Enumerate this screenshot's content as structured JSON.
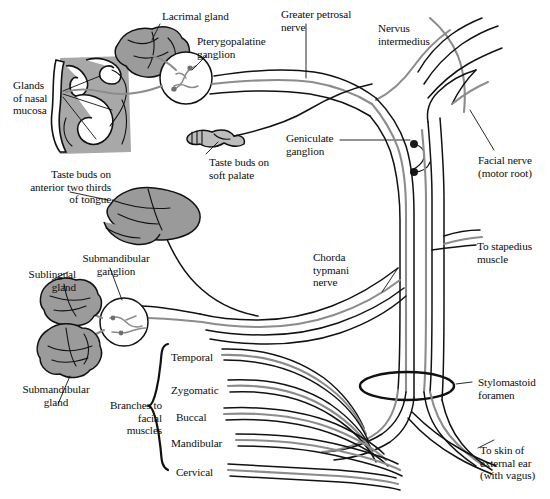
{
  "figure": {
    "width": 550,
    "height": 499,
    "background": "#ffffff"
  },
  "colors": {
    "ink": "#0d0d0d",
    "parasympathetic_gray": "#8c8c8c",
    "motor_dark": "#3a3a3a",
    "gland_fill": "#9b9b9b",
    "gland_fill_light": "#b4b4b4",
    "nasal_fill": "#a8a8a8",
    "tongue_fill": "#9a9a9a",
    "palate_fill": "#bdbdbd",
    "white": "#ffffff"
  },
  "labels": [
    {
      "id": "lacrimal-gland",
      "text": "Lacrimal gland",
      "x": 162,
      "y": 10,
      "align": "left"
    },
    {
      "id": "pterygopalatine",
      "text": "Pterygopalatine\nganglion",
      "x": 197,
      "y": 35,
      "align": "left"
    },
    {
      "id": "greater-petrosal",
      "text": "Greater petrosal\nnerve",
      "x": 281,
      "y": 8,
      "align": "left"
    },
    {
      "id": "nervus-intermedius",
      "text": "Nervus\nintermedius",
      "x": 378,
      "y": 22,
      "align": "left"
    },
    {
      "id": "glands-nasal-mucosa",
      "text": "Glands\nof nasal\nmucosa",
      "x": 13,
      "y": 79,
      "align": "left"
    },
    {
      "id": "geniculate-ganglion",
      "text": "Geniculate\nganglion",
      "x": 286,
      "y": 132,
      "align": "left"
    },
    {
      "id": "facial-nerve-motor",
      "text": "Facial nerve\n(motor root)",
      "x": 478,
      "y": 154,
      "align": "left"
    },
    {
      "id": "taste-soft-palate",
      "text": "Taste buds on\nsoft palate",
      "x": 209,
      "y": 156,
      "align": "left"
    },
    {
      "id": "taste-tongue",
      "text": "Taste buds on\nanterior two thirds\nof tongue",
      "x": 6,
      "y": 168,
      "align": "right",
      "w": 105
    },
    {
      "id": "chorda-tympani",
      "text": "Chorda\ntypmani\nnerve",
      "x": 313,
      "y": 251,
      "align": "left"
    },
    {
      "id": "to-stapedius",
      "text": "To stapedius\nmuscle",
      "x": 477,
      "y": 240,
      "align": "left"
    },
    {
      "id": "submandibular-ganglion",
      "text": "Submandibular\nganglion",
      "x": 66,
      "y": 252,
      "align": "center",
      "w": 100
    },
    {
      "id": "sublingual-gland",
      "text": "Sublingual\ngland",
      "x": 10,
      "y": 268,
      "align": "right",
      "w": 66
    },
    {
      "id": "submandibular-gland",
      "text": "Submandibular\ngland",
      "x": 12,
      "y": 383,
      "align": "center",
      "w": 88
    },
    {
      "id": "branches-facial",
      "text": "Branches to\nfacial\nmuscles",
      "x": 100,
      "y": 399,
      "align": "right",
      "w": 62
    },
    {
      "id": "temporal",
      "text": "Temporal",
      "x": 171,
      "y": 351,
      "align": "left"
    },
    {
      "id": "zygomatic",
      "text": "Zygomatic",
      "x": 171,
      "y": 384,
      "align": "left"
    },
    {
      "id": "buccal",
      "text": "Buccal",
      "x": 176,
      "y": 411,
      "align": "left"
    },
    {
      "id": "mandibular",
      "text": "Mandibular",
      "x": 171,
      "y": 437,
      "align": "left"
    },
    {
      "id": "cervical",
      "text": "Cervical",
      "x": 176,
      "y": 466,
      "align": "left"
    },
    {
      "id": "stylomastoid-foramen",
      "text": "Stylomastoid\nforamen",
      "x": 478,
      "y": 376,
      "align": "left"
    },
    {
      "id": "to-skin-external-ear",
      "text": "To skin of\nexternal ear\n(with vagus)",
      "x": 480,
      "y": 444,
      "align": "left"
    }
  ],
  "structures": [
    {
      "id": "lacrimal-gland-shape",
      "name": "lacrimal gland"
    },
    {
      "id": "nasal-mucosa-shape",
      "name": "nasal cavity cross-section"
    },
    {
      "id": "soft-palate-shape",
      "name": "soft palate"
    },
    {
      "id": "tongue-shape",
      "name": "tongue"
    },
    {
      "id": "sublingual-gland-shape",
      "name": "sublingual gland"
    },
    {
      "id": "submandibular-gland-shape",
      "name": "submandibular gland"
    },
    {
      "id": "pterygopalatine-ganglion-circle",
      "name": "pterygopalatine ganglion"
    },
    {
      "id": "submandibular-ganglion-circle",
      "name": "submandibular ganglion"
    },
    {
      "id": "geniculate-ganglion-dots",
      "name": "geniculate ganglion cell bodies"
    },
    {
      "id": "stylomastoid-foramen-ellipse",
      "name": "stylomastoid foramen"
    }
  ]
}
